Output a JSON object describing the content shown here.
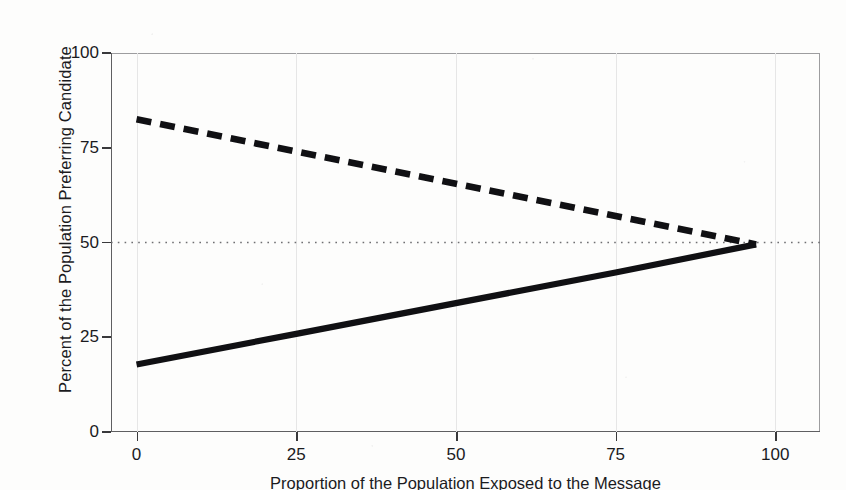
{
  "chart_data": {
    "type": "line",
    "title": "",
    "xlabel": "Proportion of the Population Exposed to the Message",
    "ylabel": "Percent of the Population Preferring Candidate",
    "xlim": [
      -4,
      107
    ],
    "ylim": [
      0,
      100
    ],
    "xticks": [
      0,
      25,
      50,
      75,
      100
    ],
    "yticks": [
      0,
      25,
      50,
      75,
      100
    ],
    "xtick_labels": [
      "0",
      "25",
      "50",
      "75",
      "100"
    ],
    "ytick_labels": [
      "0",
      "25",
      "50",
      "75",
      "100"
    ],
    "grid": "faint vertical gridlines at x ticks",
    "legend": "none",
    "reference_lines": [
      {
        "name": "fifty-percent-line",
        "orientation": "horizontal",
        "value": 50,
        "style": "dotted",
        "color": "#6f6f72"
      }
    ],
    "series": [
      {
        "name": "declining-candidate",
        "style": "dashed",
        "color": "#101013",
        "x": [
          0,
          25,
          50,
          75,
          97
        ],
        "values": [
          82.5,
          74.0,
          65.5,
          57.0,
          49.5
        ]
      },
      {
        "name": "rising-candidate",
        "style": "solid",
        "color": "#101013",
        "x": [
          0,
          25,
          50,
          75,
          97
        ],
        "values": [
          17.8,
          25.9,
          34.0,
          42.1,
          49.5
        ]
      }
    ]
  },
  "axis": {
    "y_title": "Percent of the Population Preferring Candidate",
    "x_title": "Proportion of the Population Exposed to the Message"
  }
}
